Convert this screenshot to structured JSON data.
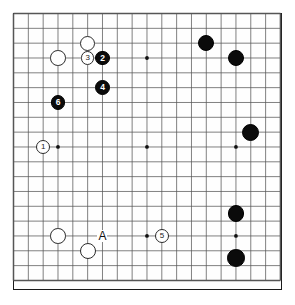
{
  "board": {
    "title": "Go board diagram",
    "size": 19,
    "origin_x": 13.5,
    "origin_y": 13.5,
    "spacing": 14.83,
    "line_color": "#555555",
    "border_color": "#1a1a1a",
    "background_color": "#ffffff",
    "black_color": "#0b0b0b",
    "white_color": "#ffffff",
    "star_points": [
      {
        "col": 3,
        "row": 3
      },
      {
        "col": 9,
        "row": 3
      },
      {
        "col": 15,
        "row": 3
      },
      {
        "col": 3,
        "row": 9
      },
      {
        "col": 9,
        "row": 9
      },
      {
        "col": 15,
        "row": 9
      },
      {
        "col": 3,
        "row": 15
      },
      {
        "col": 9,
        "row": 15
      },
      {
        "col": 15,
        "row": 15
      }
    ]
  },
  "stones": [
    {
      "id": "white-d17",
      "color": "white",
      "col": 5,
      "row": 2,
      "label": "",
      "radius": 7.5
    },
    {
      "id": "white-move3",
      "color": "white",
      "col": 5,
      "row": 3,
      "label": "3",
      "radius": 6.6
    },
    {
      "id": "black-move2",
      "color": "black",
      "col": 6,
      "row": 3,
      "label": "2",
      "radius": 7.2
    },
    {
      "id": "white-d16",
      "color": "white",
      "col": 3,
      "row": 3,
      "label": "",
      "radius": 7.8
    },
    {
      "id": "black-move4",
      "color": "black",
      "col": 6,
      "row": 5,
      "label": "4",
      "radius": 7.4
    },
    {
      "id": "black-move6",
      "color": "black",
      "col": 3,
      "row": 6,
      "label": "6",
      "radius": 7.2
    },
    {
      "id": "white-move1",
      "color": "white",
      "col": 2,
      "row": 9,
      "label": "1",
      "radius": 7.2
    },
    {
      "id": "black-q17",
      "color": "black",
      "col": 13,
      "row": 2,
      "label": "",
      "radius": 8.2
    },
    {
      "id": "black-r16",
      "color": "black",
      "col": 15,
      "row": 3,
      "label": "",
      "radius": 8.2
    },
    {
      "id": "black-s11",
      "color": "black",
      "col": 16,
      "row": 8,
      "label": "",
      "radius": 8.6
    },
    {
      "id": "black-r6",
      "color": "black",
      "col": 15,
      "row": 13.5,
      "label": "",
      "radius": 8.4
    },
    {
      "id": "black-r3",
      "color": "black",
      "col": 15,
      "row": 16.5,
      "label": "",
      "radius": 8.8
    },
    {
      "id": "white-d3",
      "color": "white",
      "col": 3,
      "row": 15,
      "label": "",
      "radius": 7.8
    },
    {
      "id": "white-f2",
      "color": "white",
      "col": 5,
      "row": 16,
      "label": "",
      "radius": 8.0
    },
    {
      "id": "white-move5",
      "color": "white",
      "col": 10,
      "row": 15,
      "label": "5",
      "radius": 7.2
    }
  ],
  "markers": [
    {
      "id": "point-a",
      "label": "A",
      "col": 6,
      "row": 15
    }
  ]
}
